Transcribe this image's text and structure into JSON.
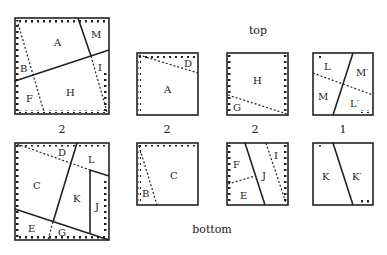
{
  "headings": {
    "top": "top",
    "bottom": "bottom"
  },
  "counts": {
    "top_big": "2",
    "top_a": "2",
    "top_h": "2",
    "top_lm": "1",
    "bottom_big": "2"
  },
  "labels": {
    "top_big": [
      "A",
      "M",
      "B",
      "I",
      "F",
      "H"
    ],
    "top_a": [
      "D",
      "A"
    ],
    "top_h": [
      "H",
      "G"
    ],
    "top_lm": [
      "L",
      "M′",
      "M",
      "L′"
    ],
    "bottom_big": [
      "D",
      "L",
      "C",
      "K",
      "J",
      "E",
      "G"
    ],
    "bottom_c": [
      "C",
      "B"
    ],
    "bottom_fej": [
      "F",
      "I",
      "J",
      "E"
    ],
    "bottom_k": [
      "K",
      "K′"
    ]
  }
}
